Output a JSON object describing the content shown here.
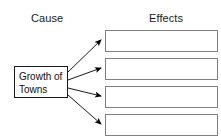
{
  "canvas": {
    "width": 221,
    "height": 140,
    "background": "#ffffff"
  },
  "clipped_top_text": "",
  "headers": {
    "cause": "Cause",
    "effects": "Effects"
  },
  "cause": {
    "label": "Growth of\nTowns",
    "border_color": "#1a1a1a",
    "fill": "#ffffff"
  },
  "effects": {
    "border_color": "#808080",
    "fill": "#ffffff",
    "boxes": [
      {
        "label": ""
      },
      {
        "label": ""
      },
      {
        "label": ""
      },
      {
        "label": ""
      }
    ]
  },
  "arrows": {
    "color": "#000000",
    "count": 4
  }
}
